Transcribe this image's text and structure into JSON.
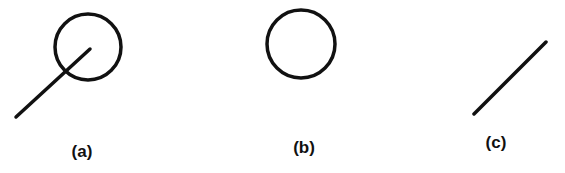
{
  "stroke_color": "#111111",
  "figures": [
    {
      "id": "a",
      "label": "(a)",
      "description": "circle with line segment passing through it",
      "circle": {
        "cx": 88,
        "cy": 47,
        "r": 33
      },
      "line": {
        "x1": 16,
        "y1": 117,
        "x2": 90,
        "y2": 49
      },
      "label_pos": {
        "x": 82,
        "y": 143
      }
    },
    {
      "id": "b",
      "label": "(b)",
      "description": "circle only",
      "circle": {
        "cx": 301,
        "cy": 44,
        "r": 34
      },
      "label_pos": {
        "x": 304,
        "y": 139
      }
    },
    {
      "id": "c",
      "label": "(c)",
      "description": "line segment only",
      "line": {
        "x1": 474,
        "y1": 114,
        "x2": 546,
        "y2": 42
      },
      "label_pos": {
        "x": 496,
        "y": 134
      }
    }
  ]
}
